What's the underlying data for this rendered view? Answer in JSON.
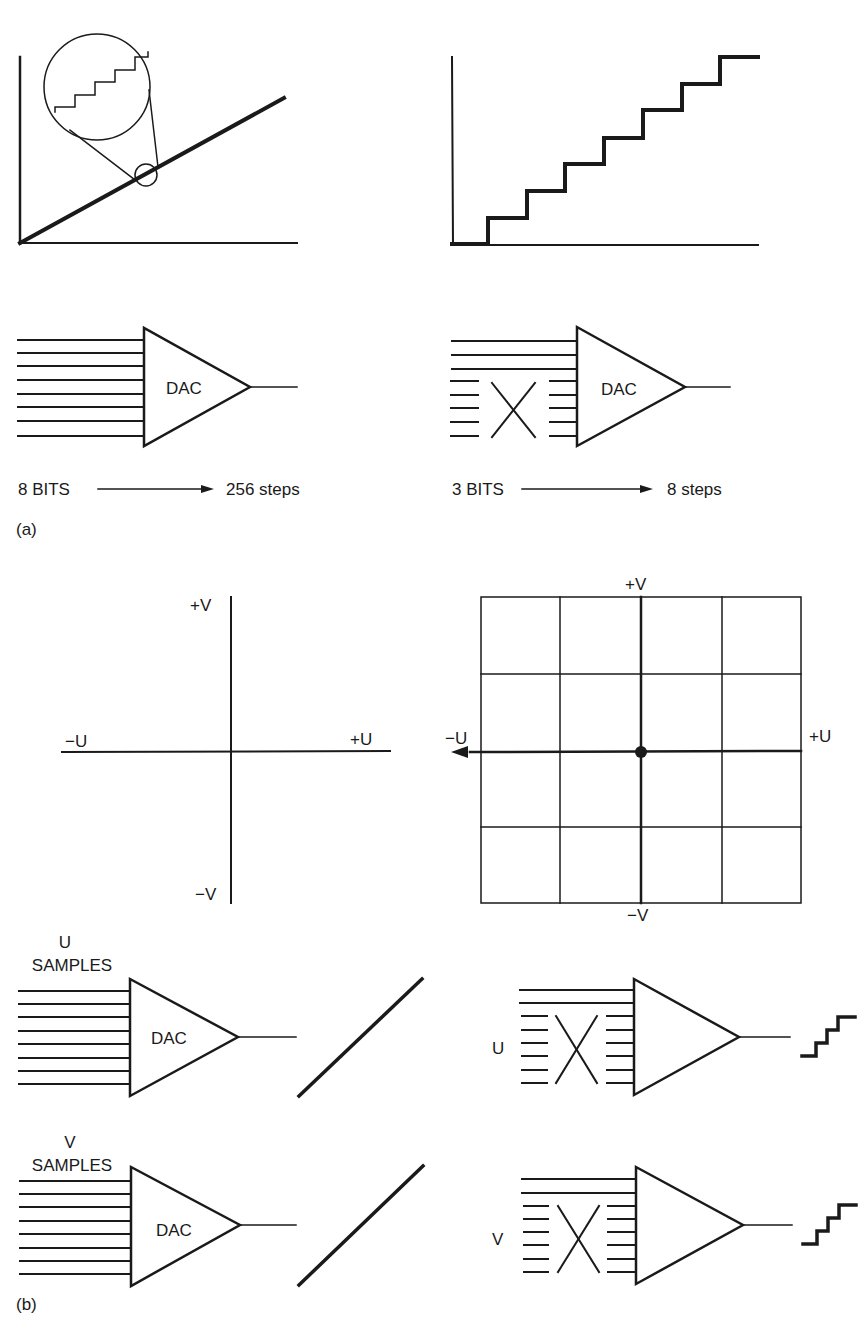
{
  "header_fragment": "... consecutive principle ...",
  "part_a": {
    "label": "(a)",
    "left": {
      "graph": "smooth ramp with magnified inset showing fine steps",
      "dac_label": "DAC",
      "input_lines": 8,
      "caption_bits": "8 BITS",
      "caption_steps": "256 steps"
    },
    "right": {
      "graph": "coarse staircase",
      "staircase_levels": 8,
      "dac_label": "DAC",
      "active_input_lines": 3,
      "dropped_input_lines": 5,
      "caption_bits": "3 BITS",
      "caption_steps": "8 steps"
    }
  },
  "part_b": {
    "label": "(b)",
    "left_axes": {
      "plus_v": "+V",
      "minus_v": "−V",
      "plus_u": "+U",
      "minus_u": "−U"
    },
    "right_grid": {
      "plus_v": "+V",
      "minus_v": "−V",
      "plus_u": "+U",
      "minus_u": "−U",
      "columns": 4,
      "rows": 4
    },
    "left_dacs": [
      {
        "title_line1": "U",
        "title_line2": "SAMPLES",
        "dac_label": "DAC",
        "output": "ramp"
      },
      {
        "title_line1": "V",
        "title_line2": "SAMPLES",
        "dac_label": "DAC",
        "output": "ramp"
      }
    ],
    "right_dacs": [
      {
        "side_label": "U",
        "output": "staircase"
      },
      {
        "side_label": "V",
        "output": "staircase"
      }
    ]
  }
}
